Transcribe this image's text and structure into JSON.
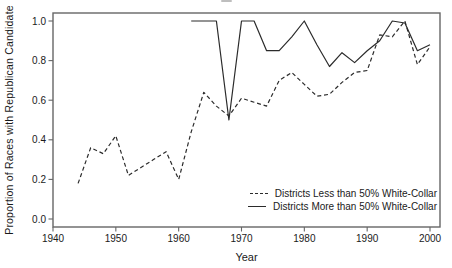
{
  "colors": {
    "line": "#2b2b2b",
    "frame": "#666666",
    "text": "#1a1a1a",
    "background": "#ffffff"
  },
  "chart_data": {
    "type": "line",
    "title": "",
    "xlabel": "Year",
    "ylabel": "Proportion of Races with Republican Candidate",
    "xlim": [
      1940,
      2002
    ],
    "ylim": [
      -0.04,
      1.04
    ],
    "grid": false,
    "legend_position": "inside-bottom-right",
    "x_ticks": [
      1940,
      1950,
      1960,
      1970,
      1980,
      1990,
      2000
    ],
    "x_tick_labels": [
      "1940",
      "1950",
      "1960",
      "1970",
      "1980",
      "1990",
      "2000"
    ],
    "y_ticks": [
      0.0,
      0.2,
      0.4,
      0.6,
      0.8,
      1.0
    ],
    "y_tick_labels": [
      "0.0",
      "0.2",
      "0.4",
      "0.6",
      "0.8",
      "1.0"
    ],
    "series": [
      {
        "id": "less-than-50-white-collar",
        "name": "Districts Less than 50% White-Collar",
        "style": "dashed",
        "x": [
          1944,
          1946,
          1948,
          1950,
          1952,
          1954,
          1956,
          1958,
          1960,
          1962,
          1964,
          1966,
          1968,
          1970,
          1972,
          1974,
          1976,
          1978,
          1980,
          1982,
          1984,
          1986,
          1988,
          1990,
          1992,
          1994,
          1996,
          1998,
          2000
        ],
        "y": [
          0.18,
          0.36,
          0.33,
          0.42,
          0.22,
          0.26,
          0.3,
          0.34,
          0.2,
          0.44,
          0.64,
          0.57,
          0.52,
          0.61,
          0.59,
          0.57,
          0.7,
          0.74,
          0.68,
          0.62,
          0.63,
          0.69,
          0.74,
          0.75,
          0.93,
          0.92,
          1.0,
          0.78,
          0.87
        ]
      },
      {
        "id": "more-than-50-white-collar",
        "name": "Districts More than 50% White-Collar",
        "style": "solid",
        "x": [
          1962,
          1964,
          1966,
          1968,
          1970,
          1972,
          1974,
          1976,
          1978,
          1980,
          1982,
          1984,
          1986,
          1988,
          1990,
          1992,
          1994,
          1996,
          1998,
          2000
        ],
        "y": [
          1.0,
          1.0,
          1.0,
          0.5,
          1.0,
          1.0,
          0.85,
          0.85,
          0.92,
          1.0,
          0.88,
          0.77,
          0.84,
          0.79,
          0.85,
          0.9,
          1.0,
          0.99,
          0.85,
          0.88
        ]
      }
    ]
  }
}
